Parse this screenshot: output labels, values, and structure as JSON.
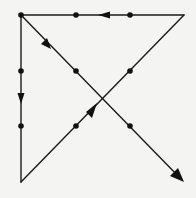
{
  "diagram": {
    "colors": {
      "background": "#f4f4f2",
      "line": "#1a1a1a",
      "dot": "#111111"
    },
    "dots": [
      {
        "x": 21,
        "y": 15
      },
      {
        "x": 76,
        "y": 15
      },
      {
        "x": 130,
        "y": 15
      },
      {
        "x": 21,
        "y": 71
      },
      {
        "x": 76,
        "y": 71
      },
      {
        "x": 130,
        "y": 71
      },
      {
        "x": 21,
        "y": 126
      },
      {
        "x": 76,
        "y": 126
      },
      {
        "x": 130,
        "y": 126
      }
    ],
    "path": [
      {
        "from": [
          21,
          15
        ],
        "to": [
          21,
          182
        ],
        "arrow_at": [
          21,
          100
        ],
        "direction": "down"
      },
      {
        "from": [
          21,
          182
        ],
        "to": [
          184,
          15
        ],
        "arrow_at": [
          95,
          107
        ],
        "direction": "up-right"
      },
      {
        "from": [
          184,
          15
        ],
        "to": [
          21,
          15
        ],
        "arrow_at": [
          103,
          15
        ],
        "direction": "left"
      },
      {
        "from": [
          21,
          15
        ],
        "to": [
          184,
          182
        ],
        "arrow_at": [
          184,
          182
        ],
        "direction": "down-right",
        "arrow_mid": [
          50,
          45
        ]
      }
    ]
  }
}
